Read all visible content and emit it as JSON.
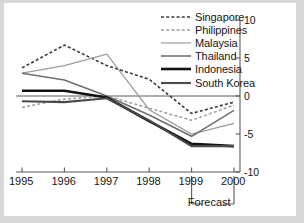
{
  "chart_data": {
    "type": "line",
    "title": "",
    "subtitle": "",
    "xlabel": "",
    "ylabel": "",
    "categories": [
      "1995",
      "1996",
      "1997",
      "1998",
      "1999",
      "2000"
    ],
    "x": [
      1995,
      1996,
      1997,
      1998,
      1999,
      2000
    ],
    "xlim": [
      1995,
      2000
    ],
    "ylim": [
      -10,
      10
    ],
    "yticks": [
      10,
      5,
      0,
      -5,
      -10
    ],
    "ytick_labels": [
      "10",
      "5",
      "0",
      "-5",
      "-10"
    ],
    "y_axis_position": "right",
    "grid": false,
    "zero_line": true,
    "legend_position": "top-right",
    "annotation": "Forecast",
    "annotation_span": [
      "1999",
      "2000"
    ],
    "series": [
      {
        "name": "Singapore",
        "values": [
          3.7,
          6.7,
          4.0,
          2.2,
          -2.3,
          -0.8
        ],
        "color": "#3a3a3a",
        "style": "dashed",
        "width": 1.6,
        "dash": "3,2.2"
      },
      {
        "name": "Philippines",
        "values": [
          -1.5,
          -0.4,
          0.0,
          -1.6,
          -3.2,
          -1.2
        ],
        "color": "#9b9b9b",
        "style": "dashed",
        "width": 1.5,
        "dash": "3,2.2"
      },
      {
        "name": "Malaysia",
        "values": [
          3.0,
          4.0,
          5.5,
          -1.8,
          -5.0,
          -3.6
        ],
        "color": "#9a9a9a",
        "style": "solid",
        "width": 1.2,
        "dash": ""
      },
      {
        "name": "Thailand",
        "values": [
          3.0,
          2.1,
          0.0,
          -2.5,
          -5.3,
          -1.9
        ],
        "color": "#6e6e6e",
        "style": "solid",
        "width": 1.5,
        "dash": ""
      },
      {
        "name": "Indonesia",
        "values": [
          0.7,
          0.7,
          -0.2,
          -3.3,
          -6.3,
          -6.6
        ],
        "color": "#111111",
        "style": "solid",
        "width": 2.6,
        "dash": ""
      },
      {
        "name": "South Korea",
        "values": [
          -0.7,
          -0.8,
          -0.3,
          -3.2,
          -6.6,
          -6.6
        ],
        "color": "#4a4a4a",
        "style": "solid",
        "width": 2.1,
        "dash": ""
      }
    ]
  },
  "colors": {
    "page_background": "#d8d8d8",
    "card_background": "#ffffff",
    "axis": "#5a5a5a",
    "text": "#161616"
  }
}
